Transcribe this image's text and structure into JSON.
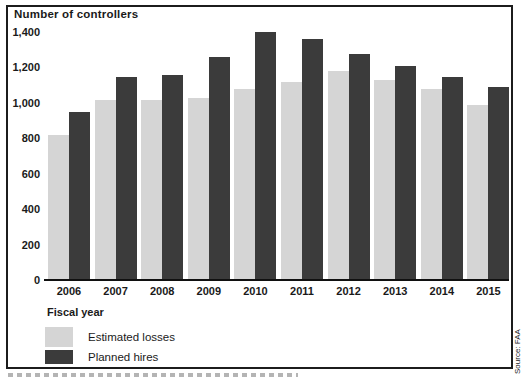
{
  "figure": {
    "source_credit": "Source: FAA"
  },
  "chart_data": {
    "type": "bar",
    "title": "Number of controllers",
    "x_axis_title": "Fiscal year",
    "categories": [
      "2006",
      "2007",
      "2008",
      "2009",
      "2010",
      "2011",
      "2012",
      "2013",
      "2014",
      "2015"
    ],
    "series": [
      {
        "name": "Estimated losses",
        "color": "#d5d5d5",
        "values": [
          810,
          1010,
          1010,
          1020,
          1070,
          1110,
          1170,
          1120,
          1070,
          980
        ]
      },
      {
        "name": "Planned hires",
        "color": "#3b3b3b",
        "values": [
          940,
          1140,
          1150,
          1250,
          1390,
          1350,
          1270,
          1200,
          1140,
          1080
        ]
      }
    ],
    "ylim": [
      0,
      1400
    ],
    "ytick_step": 200,
    "ytick_labels": [
      "0",
      "200",
      "400",
      "600",
      "800",
      "1,000",
      "1,200",
      "1,400"
    ],
    "grid": false,
    "legend_position": "bottom-left",
    "frame_color": "#1c1c1c",
    "axis_color": "#101010"
  }
}
